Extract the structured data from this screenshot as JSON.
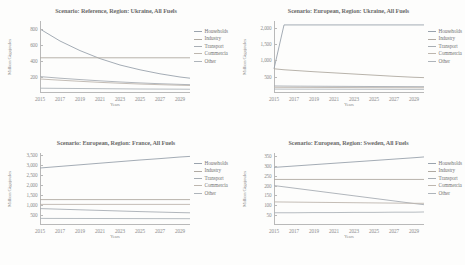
{
  "figure": {
    "axis_y_title": "Million Gigajoules",
    "axis_x_title": "Years",
    "series_colors": {
      "Households": "#9aa3ad",
      "Industry": "#b0aaa2",
      "Transport": "#a8aeb4",
      "Commercia": "#bdb6ae",
      "Other": "#aeb4ba"
    }
  },
  "charts": [
    {
      "id": "chart-reference-ukraine",
      "title": "Scenario: Reference, Region: Ukraine, All Fuels",
      "chart_data": {
        "type": "line",
        "title": "Scenario: Reference, Region: Ukraine, All Fuels",
        "xlabel": "Years",
        "ylabel": "Million Gigajoules",
        "xlim": [
          2015,
          2030
        ],
        "ylim": [
          0,
          900
        ],
        "yticks": [
          200,
          400,
          600,
          800
        ],
        "ytick_labels": [
          "200",
          "400",
          "600",
          "800"
        ],
        "xticks": [
          2015,
          2017,
          2019,
          2021,
          2023,
          2025,
          2027,
          2029
        ],
        "xtick_labels": [
          "2015",
          "2017",
          "2019",
          "2021",
          "2023",
          "2025",
          "2027",
          "2029"
        ],
        "grid": false,
        "legend_position": "right",
        "x": [
          2015,
          2017,
          2019,
          2021,
          2023,
          2025,
          2027,
          2029,
          2030
        ],
        "series": [
          {
            "name": "Households",
            "values": [
              800,
              650,
              530,
              430,
              350,
              290,
              240,
              200,
              185
            ]
          },
          {
            "name": "Industry",
            "values": [
              440,
              440,
              440,
              440,
              440,
              440,
              440,
              440,
              440
            ]
          },
          {
            "name": "Transport",
            "values": [
              205,
              185,
              168,
              152,
              138,
              126,
              116,
              108,
              104
            ]
          },
          {
            "name": "Commercia",
            "values": [
              175,
              160,
              146,
              133,
              122,
              112,
              104,
              97,
              94
            ]
          },
          {
            "name": "Other",
            "values": [
              60,
              58,
              56,
              54,
              52,
              50,
              49,
              48,
              47
            ]
          }
        ]
      }
    },
    {
      "id": "chart-european-ukraine",
      "title": "Scenario: European, Region: Ukraine, All Fuels",
      "chart_data": {
        "type": "line",
        "title": "Scenario: European, Region: Ukraine, All Fuels",
        "xlabel": "Years",
        "ylabel": "Million Gigajoules",
        "xlim": [
          2015,
          2030
        ],
        "ylim": [
          0,
          2200
        ],
        "yticks": [
          500,
          1000,
          1500,
          2000
        ],
        "ytick_labels": [
          "500",
          "1,000",
          "1,500",
          "2,000"
        ],
        "xticks": [
          2015,
          2017,
          2019,
          2021,
          2023,
          2025,
          2027,
          2029
        ],
        "xtick_labels": [
          "2015",
          "2017",
          "2019",
          "2021",
          "2023",
          "2025",
          "2027",
          "2029"
        ],
        "grid": false,
        "legend_position": "right",
        "x": [
          2015,
          2016,
          2017,
          2019,
          2021,
          2023,
          2025,
          2027,
          2029,
          2030
        ],
        "series": [
          {
            "name": "Households",
            "values": [
              740,
              2080,
              2080,
              2080,
              2080,
              2080,
              2080,
              2080,
              2080,
              2080
            ]
          },
          {
            "name": "Industry",
            "values": [
              740,
              710,
              690,
              650,
              615,
              580,
              545,
              510,
              480,
              470
            ]
          },
          {
            "name": "Transport",
            "values": [
              215,
              212,
              210,
              207,
              204,
              201,
              198,
              196,
              194,
              193
            ]
          },
          {
            "name": "Commercia",
            "values": [
              175,
              173,
              172,
              170,
              168,
              166,
              164,
              163,
              162,
              161
            ]
          },
          {
            "name": "Other",
            "values": [
              120,
              119,
              118,
              117,
              116,
              115,
              114,
              113,
              112,
              112
            ]
          }
        ]
      }
    },
    {
      "id": "chart-european-france",
      "title": "Scenario: European, Region: France, All Fuels",
      "chart_data": {
        "type": "line",
        "title": "Scenario: European, Region: France, All Fuels",
        "xlabel": "Years",
        "ylabel": "Million Gigajoules",
        "xlim": [
          2015,
          2030
        ],
        "ylim": [
          0,
          3600
        ],
        "yticks": [
          500,
          1000,
          1500,
          2000,
          2500,
          3000,
          3500
        ],
        "ytick_labels": [
          "500",
          "1,000",
          "1,500",
          "2,000",
          "2,500",
          "3,000",
          "3,500"
        ],
        "xticks": [
          2015,
          2017,
          2019,
          2021,
          2023,
          2025,
          2027,
          2029
        ],
        "xtick_labels": [
          "2015",
          "2017",
          "2019",
          "2021",
          "2023",
          "2025",
          "2027",
          "2029"
        ],
        "grid": false,
        "legend_position": "right",
        "x": [
          2015,
          2017,
          2019,
          2021,
          2023,
          2025,
          2027,
          2029,
          2030
        ],
        "series": [
          {
            "name": "Households",
            "values": [
              2850,
              2930,
              3010,
              3090,
              3170,
              3250,
              3320,
              3400,
              3430
            ]
          },
          {
            "name": "Industry",
            "values": [
              1270,
              1270,
              1270,
              1270,
              1270,
              1270,
              1270,
              1270,
              1270
            ]
          },
          {
            "name": "Transport",
            "values": [
              820,
              790,
              760,
              730,
              700,
              670,
              645,
              620,
              610
            ]
          },
          {
            "name": "Commercia",
            "values": [
              1030,
              1030,
              1030,
              1030,
              1030,
              1030,
              1030,
              1030,
              1030
            ]
          },
          {
            "name": "Other",
            "values": [
              330,
              328,
              326,
              324,
              322,
              320,
              318,
              316,
              315
            ]
          }
        ]
      }
    },
    {
      "id": "chart-european-sweden",
      "title": "Scenario: European, Region: Sweden, All Fuels",
      "chart_data": {
        "type": "line",
        "title": "Scenario: European, Region: Sweden, All Fuels",
        "xlabel": "Years",
        "ylabel": "Million Gigajoules",
        "xlim": [
          2015,
          2030
        ],
        "ylim": [
          0,
          365
        ],
        "yticks": [
          50,
          100,
          150,
          200,
          250,
          300,
          350
        ],
        "ytick_labels": [
          "50",
          "100",
          "150",
          "200",
          "250",
          "300",
          "350"
        ],
        "xticks": [
          2015,
          2017,
          2019,
          2021,
          2023,
          2025,
          2027,
          2029
        ],
        "xtick_labels": [
          "2015",
          "2017",
          "2019",
          "2021",
          "2023",
          "2025",
          "2027",
          "2029"
        ],
        "grid": false,
        "legend_position": "right",
        "x": [
          2015,
          2017,
          2019,
          2021,
          2023,
          2025,
          2027,
          2029,
          2030
        ],
        "series": [
          {
            "name": "Households",
            "values": [
              292,
              299,
              306,
              313,
              320,
              327,
              334,
              341,
              345
            ]
          },
          {
            "name": "Industry",
            "values": [
              231,
              231,
              231,
              231,
              231,
              231,
              231,
              231,
              231
            ]
          },
          {
            "name": "Transport",
            "values": [
              200,
              187,
              174,
              161,
              148,
              135,
              122,
              109,
              103
            ]
          },
          {
            "name": "Commercia",
            "values": [
              117,
              116,
              115,
              114,
              113,
              112,
              111,
              110,
              110
            ]
          },
          {
            "name": "Other",
            "values": [
              62,
              62,
              63,
              63,
              64,
              64,
              65,
              65,
              66
            ]
          }
        ]
      }
    }
  ]
}
